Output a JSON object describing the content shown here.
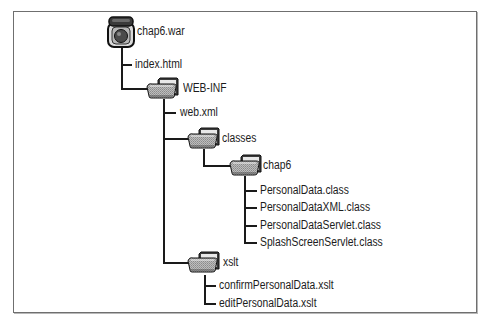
{
  "diagram": {
    "type": "directory-tree",
    "root": {
      "name": "chap6.war",
      "icon": "war-archive-icon",
      "children": [
        {
          "name": "index.html",
          "type": "file"
        },
        {
          "name": "WEB-INF",
          "type": "folder",
          "icon": "folder-icon",
          "children": [
            {
              "name": "web.xml",
              "type": "file"
            },
            {
              "name": "classes",
              "type": "folder",
              "icon": "folder-icon",
              "children": [
                {
                  "name": "chap6",
                  "type": "folder",
                  "icon": "folder-icon",
                  "children": [
                    {
                      "name": "PersonalData.class",
                      "type": "file"
                    },
                    {
                      "name": "PersonalDataXML.class",
                      "type": "file"
                    },
                    {
                      "name": "PersonalDataServlet.class",
                      "type": "file"
                    },
                    {
                      "name": "SplashScreenServlet.class",
                      "type": "file"
                    }
                  ]
                }
              ]
            },
            {
              "name": "xslt",
              "type": "folder",
              "icon": "folder-icon",
              "children": [
                {
                  "name": "confirmPersonalData.xslt",
                  "type": "file"
                },
                {
                  "name": "editPersonalData.xslt",
                  "type": "file"
                }
              ]
            }
          ]
        }
      ]
    }
  },
  "labels": {
    "root": "chap6.war",
    "index_html": "index.html",
    "web_inf": "WEB-INF",
    "web_xml": "web.xml",
    "classes": "classes",
    "chap6": "chap6",
    "personal_data_class": "PersonalData.class",
    "personal_data_xml_class": "PersonalDataXML.class",
    "personal_data_servlet_class": "PersonalDataServlet.class",
    "splash_screen_servlet_class": "SplashScreenServlet.class",
    "xslt": "xslt",
    "confirm_xslt": "confirmPersonalData.xslt",
    "edit_xslt": "editPersonalData.xslt"
  },
  "colors": {
    "line": "#1a1a1a",
    "frame": "#6f6f6f",
    "text": "#1c1c1c"
  }
}
